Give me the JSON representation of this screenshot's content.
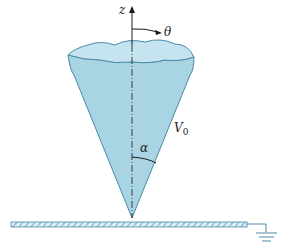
{
  "figure": {
    "labels": {
      "z_axis": "z",
      "theta": "θ",
      "angle": "α",
      "potential": "V",
      "potential_subscript": "0"
    },
    "colors": {
      "cone_fill": "#a8d4e4",
      "cone_top": "#c6e4ef",
      "outline": "#4a8aa8",
      "line": "#1a1a1a",
      "plate_fill": "#d8ecf4"
    }
  }
}
